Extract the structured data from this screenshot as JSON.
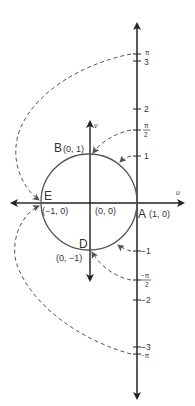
{
  "figure": {
    "type": "conformal-mapping-diagram",
    "colors": {
      "axis": "#222222",
      "circle": "#555555",
      "dashed": "#555555",
      "text": "#333333",
      "background": "#ffffff"
    },
    "axes": {
      "u_label": "u",
      "v_label": "v"
    },
    "points": {
      "A": {
        "name": "A",
        "coords": "(1, 0)"
      },
      "B": {
        "name": "B",
        "coords": "(0, 1)"
      },
      "D": {
        "name": "D",
        "coords": "(0, −1)"
      },
      "E": {
        "name": "E",
        "coords": "(−1, 0)"
      },
      "origin": {
        "coords": "(0, 0)"
      }
    },
    "line_ticks": [
      {
        "label": "π",
        "value": 3.1416,
        "kind": "frac-pi"
      },
      {
        "label": "3",
        "value": 3
      },
      {
        "label": "2",
        "value": 2
      },
      {
        "label": "π/2",
        "value": 1.5708,
        "kind": "frac"
      },
      {
        "label": "1",
        "value": 1
      },
      {
        "label": "−1",
        "value": -1
      },
      {
        "label": "−π/2",
        "value": -1.5708,
        "kind": "frac"
      },
      {
        "label": "−2",
        "value": -2
      },
      {
        "label": "−3",
        "value": -3
      },
      {
        "label": "−π",
        "value": -3.1416,
        "kind": "frac-pi"
      }
    ],
    "tick_text": {
      "pi": "π",
      "three": "3",
      "two": "2",
      "half_num": "π",
      "half_den": "2",
      "one": "1",
      "neg_one": "−1",
      "neg_half_num": "−π",
      "neg_half_den": "2",
      "neg_two": "−2",
      "neg_three": "−3",
      "neg_pi": "−π"
    },
    "mappings": [
      {
        "from": "π",
        "to": "E (−1, 0)"
      },
      {
        "from": "π/2",
        "to": "B (0, 1)"
      },
      {
        "from": "1",
        "to": "circle point near B-A"
      },
      {
        "from": "−1",
        "to": "circle point near D-A"
      },
      {
        "from": "−π/2",
        "to": "D (0, −1)"
      },
      {
        "from": "−π",
        "to": "E (−1, 0)"
      }
    ]
  }
}
